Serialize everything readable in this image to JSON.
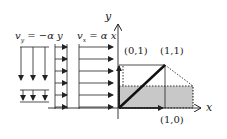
{
  "labels": {
    "vy_eq": "v",
    "vy_sub": "y",
    "vy_rhs": " = −α y",
    "vx_eq": "v",
    "vx_sub": "x",
    "vx_rhs": " = α x",
    "axis_x": "x",
    "axis_y": "y",
    "pt_01": "(0,1)",
    "pt_11": "(1,1)",
    "pt_10": "(1,0)"
  },
  "colors": {
    "line": "#222222",
    "shade": "#c8c8c8",
    "dotted": "#333333"
  }
}
